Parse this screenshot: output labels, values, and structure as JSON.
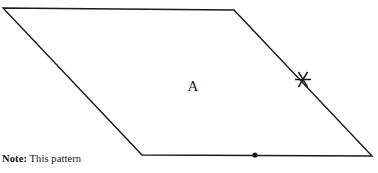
{
  "figure": {
    "background_color": "#ffffff",
    "stroke_color": "#1a1a1a",
    "shape": {
      "name": "parallelogram",
      "region_label": "A",
      "region_label_x": 193,
      "region_label_y": 91,
      "vertices": [
        {
          "name": "top-left",
          "x": 3,
          "y": 8
        },
        {
          "name": "top-right",
          "x": 234,
          "y": 10
        },
        {
          "name": "bottom-right",
          "x": 372,
          "y": 156
        },
        {
          "name": "bottom-left",
          "x": 142,
          "y": 155
        }
      ],
      "points": "3,8 234,10 372,156 142,155"
    },
    "markers": {
      "edge_tick": {
        "name": "star-tick-mark",
        "x": 303,
        "y": 79,
        "edge": "right",
        "strokes": "295,79 311,79 299,71 307,87 307,71 299,87"
      },
      "edge_dot": {
        "name": "midpoint-dot",
        "x": 255,
        "y": 155,
        "edge": "bottom",
        "radius": 2.6
      }
    }
  },
  "note": {
    "label": "Note:",
    "text": " This pattern"
  }
}
